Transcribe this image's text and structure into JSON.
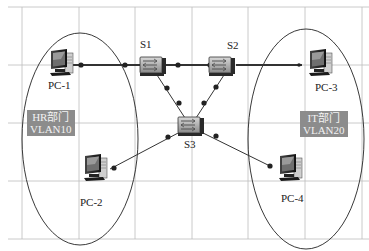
{
  "diagram": {
    "type": "network-topology",
    "switches": [
      {
        "id": "S1",
        "label": "S1"
      },
      {
        "id": "S2",
        "label": "S2"
      },
      {
        "id": "S3",
        "label": "S3"
      }
    ],
    "pcs": [
      {
        "id": "PC-1",
        "label": "PC-1"
      },
      {
        "id": "PC-2",
        "label": "PC-2"
      },
      {
        "id": "PC-3",
        "label": "PC-3"
      },
      {
        "id": "PC-4",
        "label": "PC-4"
      }
    ],
    "groups": [
      {
        "id": "hr",
        "name": "HR部门",
        "vlan": "VLAN10",
        "members": [
          "PC-1",
          "PC-2"
        ]
      },
      {
        "id": "it",
        "name": "IT部门",
        "vlan": "VLAN20",
        "members": [
          "PC-3",
          "PC-4"
        ]
      }
    ],
    "links": [
      [
        "PC-1",
        "S1"
      ],
      [
        "S1",
        "S2"
      ],
      [
        "S2",
        "PC-3"
      ],
      [
        "S1",
        "S3"
      ],
      [
        "S2",
        "S3"
      ],
      [
        "S3",
        "PC-2"
      ],
      [
        "S3",
        "PC-4"
      ]
    ],
    "colors": {
      "grid": "#bdbdbd",
      "link": "#333333",
      "ellipse": "#222222",
      "vlan_box": "#8c8c8c",
      "vlan_text": "#f2f2f2"
    }
  }
}
